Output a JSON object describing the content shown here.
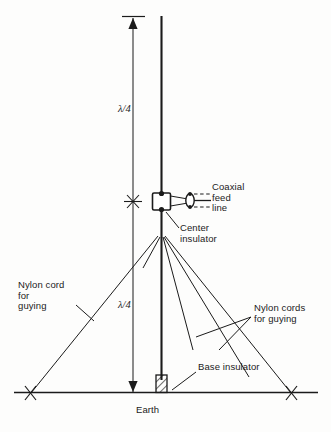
{
  "figure": {
    "name": "quarter-wave-vertical-dipole-antenna-diagram",
    "ink_color": "#1b1b1b",
    "background_color": "#fdfdfc"
  },
  "labels": {
    "lambda_top": "λ/4",
    "lambda_bottom": "λ/4",
    "coaxial_feed_line": "Coaxial\nfeed\nline",
    "center_insulator": "Center\ninsulator",
    "nylon_cord_left": "Nylon cord\nfor\nguying",
    "nylon_cords_right": "Nylon cords\nfor guying",
    "base_insulator": "Base insulator",
    "earth": "Earth"
  },
  "elements": {
    "mast_name": "vertical-antenna-mast",
    "upper_element_name": "upper-radiator-element",
    "lower_element_name": "lower-radiator-element",
    "center_insulator_name": "center-insulator-block",
    "coax_connector_name": "coax-connector",
    "base_insulator_name": "base-insulator-block",
    "ground_line_name": "earth-ground-line",
    "dimension_line_name": "dimension-line",
    "guy_wire_name": "guy-wire"
  },
  "dimensions": {
    "width": 331,
    "height": 432
  }
}
